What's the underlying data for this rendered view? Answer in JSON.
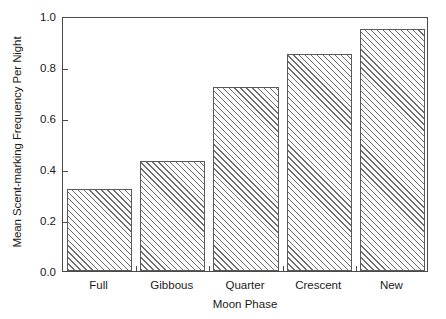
{
  "chart_data": {
    "type": "bar",
    "title": "",
    "categories": [
      "Full",
      "Gibbous",
      "Quarter",
      "Crescent",
      "New"
    ],
    "values": [
      0.32,
      0.43,
      0.72,
      0.85,
      0.95
    ],
    "series": [
      {
        "name": "Mean Scent-marking Frequency Per Night",
        "values": [
          0.32,
          0.43,
          0.72,
          0.85,
          0.95
        ]
      }
    ],
    "xlabel": "Moon Phase",
    "ylabel": "Mean Scent-marking Frequency Per Night",
    "ylim": [
      0.0,
      1.0
    ],
    "yticks": [
      0.0,
      0.2,
      0.4,
      0.6,
      0.8,
      1.0
    ],
    "ytick_labels": [
      "0.0",
      "0.2",
      "0.4",
      "0.6",
      "0.8",
      "1.0"
    ],
    "grid": false,
    "legend": false,
    "legend_position": "none",
    "bar_fill": "#fbfbfb",
    "bar_hatch": "forward-diagonal",
    "bar_edge_color": "#5a5a5a",
    "axis_color": "#4a4a4a",
    "background": "#ffffff"
  }
}
